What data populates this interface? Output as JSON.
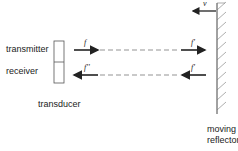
{
  "labels": {
    "transmitter": "transmitter",
    "receiver": "receiver",
    "transducer": "transducer",
    "moving": "moving",
    "reflector": "reflector"
  },
  "symbols": {
    "v": "v",
    "f_emitted": "f",
    "f_received": "f''",
    "f_reflected_in": "f'",
    "f_reflected_out": "f'"
  },
  "colors": {
    "line": "#222222",
    "dash": "#666666",
    "hatch": "#777777"
  }
}
